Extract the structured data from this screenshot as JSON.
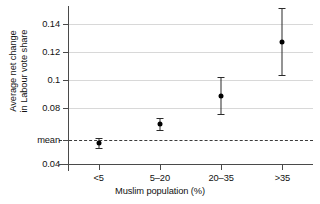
{
  "chart_data": {
    "type": "scatter",
    "title": "",
    "xlabel": "Muslim population (%)",
    "ylabel": "Average net change\nin Labour vote share",
    "categories": [
      "<5",
      "5–20",
      "20–35",
      ">35"
    ],
    "values": [
      0.055,
      0.0685,
      0.0885,
      0.127
    ],
    "error_low": [
      0.0515,
      0.0645,
      0.0755,
      0.1035
    ],
    "error_high": [
      0.0585,
      0.0725,
      0.102,
      0.151
    ],
    "series": [
      {
        "name": "Average net change in Labour vote share",
        "values": [
          0.055,
          0.0685,
          0.0885,
          0.127
        ],
        "error_low": [
          0.0515,
          0.0645,
          0.0755,
          0.1035
        ],
        "error_high": [
          0.0585,
          0.0725,
          0.102,
          0.151
        ]
      }
    ],
    "ytick_labels": [
      "0.14",
      "0.12",
      "0.1",
      "0.08",
      "mean",
      "0.04"
    ],
    "ytick_values": [
      0.14,
      0.12,
      0.1,
      0.08,
      0.057,
      0.04
    ],
    "ylim": [
      0.04,
      0.1475
    ],
    "grid": "horizontal",
    "legend": "none",
    "annotations": [
      {
        "label": "mean",
        "type": "reference-line",
        "value": 0.057,
        "style": "dashed"
      }
    ],
    "accent_color": "#000000",
    "grid_color": "#d8d8d8",
    "axis_color": "#4a4a4a"
  },
  "axes": {
    "y_title": "Average net change\nin Labour vote share",
    "x_title": "Muslim population (%)",
    "y_ticks": [
      {
        "label": "0.14",
        "value": 0.14
      },
      {
        "label": "0.12",
        "value": 0.12
      },
      {
        "label": "0.1",
        "value": 0.1
      },
      {
        "label": "0.08",
        "value": 0.08
      },
      {
        "label": "mean",
        "value": 0.057
      },
      {
        "label": "0.04",
        "value": 0.04
      }
    ],
    "x_ticks": [
      {
        "label": "<5",
        "value": 0
      },
      {
        "label": "5–20",
        "value": 1
      },
      {
        "label": "20–35",
        "value": 2
      },
      {
        "label": ">35",
        "value": 3
      }
    ]
  }
}
